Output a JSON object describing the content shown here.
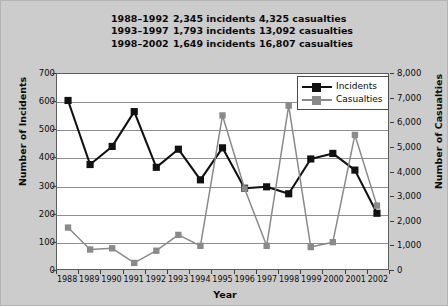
{
  "summary": {
    "rows": [
      {
        "period": "1988–1992",
        "incidents": "2,345 incidents",
        "casualties": "4,325 casualties"
      },
      {
        "period": "1993–1997",
        "incidents": "1,793 incidents",
        "casualties": "13,092 casualties"
      },
      {
        "period": "1998–2002",
        "incidents": "1,649 incidents",
        "casualties": "16,807 casualties"
      }
    ]
  },
  "legend": {
    "items": [
      {
        "label": "Incidents",
        "color": "#111111"
      },
      {
        "label": "Casualties",
        "color": "#8a8a8a"
      }
    ]
  },
  "chart_data": {
    "type": "line",
    "title": "",
    "xlabel": "Year",
    "ylabel": "Number of Incidents",
    "y2label": "Number of Casualties",
    "categories": [
      "1988",
      "1989",
      "1990",
      "1991",
      "1992",
      "1993",
      "1994",
      "1995",
      "1996",
      "1997",
      "1998",
      "1999",
      "2000",
      "2001",
      "2002"
    ],
    "ylim": [
      0,
      700
    ],
    "y2lim": [
      0,
      8000
    ],
    "yticks": [
      "0",
      "100",
      "200",
      "300",
      "400",
      "500",
      "600",
      "700"
    ],
    "y2ticks": [
      "0",
      "1,000",
      "2,000",
      "3,000",
      "4,000",
      "5,000",
      "6,000",
      "7,000",
      "8,000"
    ],
    "grid": true,
    "legend_position": "top-right",
    "series": [
      {
        "name": "Incidents",
        "axis": "left",
        "color": "#111111",
        "marker": "square",
        "values": [
          605,
          375,
          440,
          565,
          365,
          430,
          320,
          435,
          290,
          295,
          270,
          395,
          415,
          355,
          200
        ]
      },
      {
        "name": "Casualties",
        "axis": "right",
        "color": "#8a8a8a",
        "marker": "square",
        "values": [
          1700,
          800,
          850,
          250,
          750,
          1400,
          950,
          6300,
          3300,
          950,
          6700,
          900,
          1100,
          5500,
          2600
        ]
      }
    ]
  }
}
